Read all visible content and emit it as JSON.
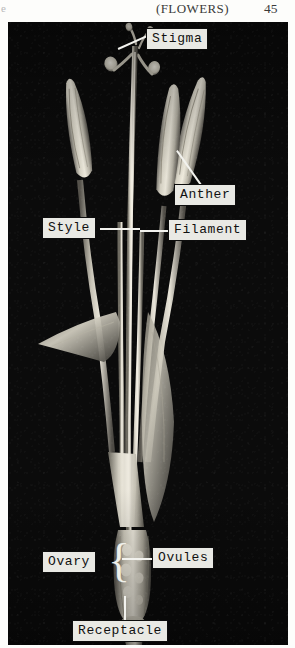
{
  "running_head": {
    "left_fragment": "e",
    "title": "(FLOWERS)",
    "page_number": "45"
  },
  "plate": {
    "kind": "black-and-white-photograph",
    "subject": "dissected-flower-specimen",
    "background_color": "#0b0b0b",
    "specimen_color": "#e4e0d4",
    "labels": [
      {
        "id": "stigma",
        "text": "Stigma",
        "x": 146,
        "y": 28,
        "leader": "diagonal-down-left"
      },
      {
        "id": "anther",
        "text": "Anther",
        "x": 174,
        "y": 184,
        "leader": "diagonal-up-left"
      },
      {
        "id": "style",
        "text": "Style",
        "x": 42,
        "y": 217,
        "leader": "horizontal-right"
      },
      {
        "id": "filament",
        "text": "Filament",
        "x": 168,
        "y": 219,
        "leader": "horizontal-left"
      },
      {
        "id": "ovary",
        "text": "Ovary",
        "x": 42,
        "y": 551,
        "leader": "brace-right"
      },
      {
        "id": "ovules",
        "text": "Ovules",
        "x": 152,
        "y": 547,
        "leader": "horizontal-left"
      },
      {
        "id": "receptacle",
        "text": "Receptacle",
        "x": 72,
        "y": 620,
        "leader": "vertical-up"
      }
    ],
    "brace": "{"
  },
  "colors": {
    "page_background": "#fdfdfb",
    "plate_background": "#0b0b0b",
    "label_fill": "#e9e9e4",
    "label_border": "#0d0d0d",
    "leader_line": "#f2f2ee",
    "text": "#101010"
  }
}
